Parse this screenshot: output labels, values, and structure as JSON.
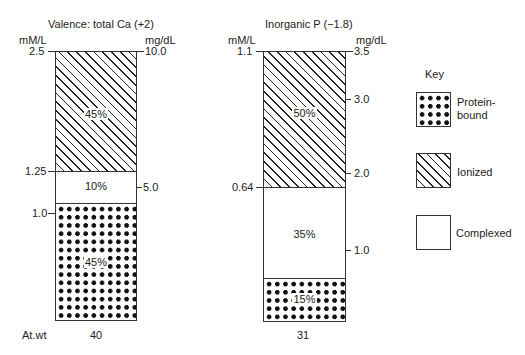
{
  "diagram": {
    "type": "stacked-bar-diagram",
    "panels": [
      {
        "title": "Valence: total Ca (+2)",
        "left_axis_label": "mM/L",
        "right_axis_label": "mg/dL",
        "left_ticks": [
          "2.5",
          "1.25",
          "1.0"
        ],
        "right_ticks": [
          "10.0",
          "5.0"
        ],
        "segments": [
          {
            "name": "Ionized",
            "pattern": "hatched",
            "percent": "45%"
          },
          {
            "name": "Complexed",
            "pattern": "plain",
            "percent": "10%"
          },
          {
            "name": "Protein-bound",
            "pattern": "dotted",
            "percent": "45%"
          }
        ],
        "at_wt": "40"
      },
      {
        "title": "Inorganic P (−1.8)",
        "left_axis_label": "mM/L",
        "right_axis_label": "mg/dL",
        "left_ticks": [
          "1.1",
          "0.64"
        ],
        "right_ticks": [
          "3.5",
          "3.0",
          "2.0",
          "1.0"
        ],
        "segments": [
          {
            "name": "Ionized",
            "pattern": "hatched",
            "percent": "50%"
          },
          {
            "name": "Complexed",
            "pattern": "plain",
            "percent": "35%"
          },
          {
            "name": "Protein-bound",
            "pattern": "dotted",
            "percent": "15%"
          }
        ],
        "at_wt": "31"
      }
    ],
    "at_wt_label": "At.wt",
    "key": {
      "title": "Key",
      "items": [
        {
          "label": "Protein-\nbound",
          "label_line1": "Protein-",
          "label_line2": "bound",
          "pattern": "dotted"
        },
        {
          "label": "Ionized",
          "pattern": "hatched"
        },
        {
          "label": "Complexed",
          "pattern": "plain"
        }
      ]
    }
  }
}
